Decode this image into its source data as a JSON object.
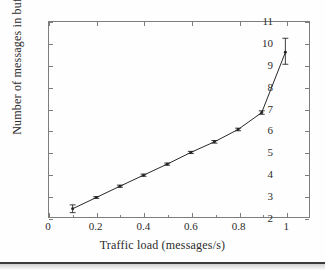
{
  "chart_data": {
    "type": "line",
    "title": "",
    "xlabel": "Traffic load (messages/s)",
    "ylabel": "Number of messages in buffer",
    "xlim": [
      0,
      1.1
    ],
    "ylim": [
      2,
      11
    ],
    "xticks": [
      0,
      0.2,
      0.4,
      0.6,
      0.8,
      1
    ],
    "xticklabels": [
      "0",
      "0.2",
      "0.4",
      "0.6",
      "0.8",
      "1"
    ],
    "yticks": [
      2,
      3,
      4,
      5,
      6,
      7,
      8,
      9,
      10,
      11
    ],
    "yticklabels": [
      "2",
      "3",
      "4",
      "5",
      "6",
      "7",
      "8",
      "9",
      "10",
      "11"
    ],
    "minor_xticks": [
      0.1,
      0.3,
      0.5,
      0.7,
      0.9
    ],
    "grid": false,
    "legend": null,
    "line_color": "#262626",
    "marker": "point",
    "errorbars": true,
    "x": [
      0.1,
      0.2,
      0.3,
      0.4,
      0.5,
      0.6,
      0.7,
      0.8,
      0.9,
      1.0
    ],
    "values": [
      2.38,
      2.9,
      3.42,
      3.93,
      4.44,
      4.98,
      5.47,
      6.04,
      6.82,
      9.6
    ],
    "yerr_lower": [
      0.18,
      0.04,
      0.05,
      0.05,
      0.05,
      0.05,
      0.06,
      0.06,
      0.08,
      0.55
    ],
    "yerr_upper": [
      0.18,
      0.04,
      0.05,
      0.05,
      0.05,
      0.05,
      0.06,
      0.06,
      0.08,
      0.65
    ],
    "series": [
      {
        "name": "Number of messages in buffer",
        "x": [
          0.1,
          0.2,
          0.3,
          0.4,
          0.5,
          0.6,
          0.7,
          0.8,
          0.9,
          1.0
        ],
        "values": [
          2.38,
          2.9,
          3.42,
          3.93,
          4.44,
          4.98,
          5.47,
          6.04,
          6.82,
          9.6
        ]
      }
    ]
  }
}
